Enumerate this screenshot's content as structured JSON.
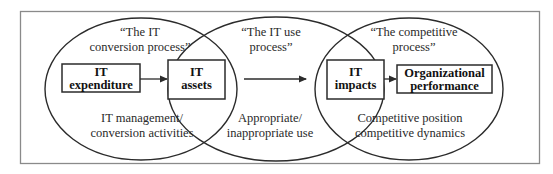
{
  "diagram": {
    "processes": [
      {
        "id": "conversion",
        "title_lines": [
          "“The IT",
          "conversion process”"
        ],
        "boxes": [
          {
            "lines": [
              "IT",
              "expenditure"
            ]
          },
          {
            "lines": [
              "IT",
              "assets"
            ]
          }
        ],
        "footer_lines": [
          "IT management/",
          "conversion activities"
        ]
      },
      {
        "id": "use",
        "title_lines": [
          "“The IT use",
          "process”"
        ],
        "footer_lines": [
          "Appropriate/",
          "inappropriate use"
        ]
      },
      {
        "id": "competitive",
        "title_lines": [
          "“The competitive",
          "process”"
        ],
        "boxes": [
          {
            "lines": [
              "IT",
              "impacts"
            ]
          },
          {
            "lines": [
              "Organizational",
              "performance"
            ]
          }
        ],
        "footer_lines": [
          "Competitive position",
          "competitive dynamics"
        ]
      }
    ],
    "colors": {
      "stroke": "#2b2b2b",
      "frame": "#8a8a8a",
      "background": "#ffffff"
    }
  }
}
